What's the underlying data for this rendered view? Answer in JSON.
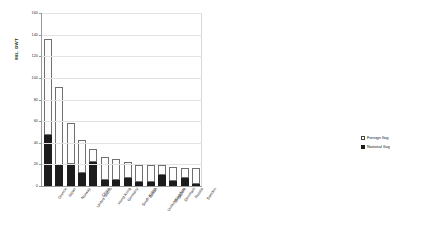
{
  "chart_data": {
    "type": "bar",
    "title": "",
    "subtitle": "",
    "xlabel": "",
    "ylabel": "MIL. DWT",
    "ylim": [
      0,
      160
    ],
    "yticks": [
      0,
      20,
      40,
      60,
      80,
      100,
      120,
      140,
      160
    ],
    "grid": true,
    "stacked": true,
    "legend_position": "right",
    "categories": [
      "Greece",
      "Japan",
      "Norway",
      "United States",
      "China",
      "Hong Kong",
      "Germany",
      "South Korea",
      "Taiwan",
      "United Kingdom",
      "Singapore",
      "Denmark",
      "Russia",
      "Sweden"
    ],
    "series": [
      {
        "name": "National flag",
        "color": "#1c1c1c",
        "values": [
          47,
          19,
          20,
          12,
          22,
          6,
          6,
          7,
          4,
          4,
          10,
          5,
          7,
          2
        ]
      },
      {
        "name": "Foreign flag",
        "color": "#ffffff",
        "values": [
          89,
          73,
          38,
          31,
          12,
          21,
          19,
          15,
          15,
          15,
          9,
          13,
          10,
          15
        ]
      }
    ],
    "totals": [
      136,
      92,
      58,
      43,
      34,
      27,
      25,
      22,
      19,
      19,
      19,
      18,
      17,
      17
    ]
  },
  "legend": {
    "items": [
      {
        "label": "Foreign flag",
        "swatch": "open-square"
      },
      {
        "label": "National flag",
        "swatch": "filled-square"
      }
    ]
  }
}
